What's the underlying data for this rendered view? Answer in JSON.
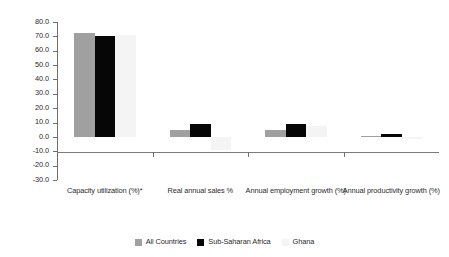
{
  "chart_data": {
    "type": "bar",
    "title": "",
    "subtitle": "",
    "xlabel": "",
    "ylabel": "",
    "grid": false,
    "legend_position": "bottom",
    "ylim": [
      -30.0,
      80.0
    ],
    "ytick_step": 10.0,
    "ytick_labels": [
      "80.0",
      "70.0",
      "60.0",
      "50.0",
      "40.0",
      "30.0",
      "20.0",
      "10.0",
      "0.0",
      "-10.0",
      "-20.0",
      "-30.0"
    ],
    "ytick_values": [
      80.0,
      70.0,
      60.0,
      50.0,
      40.0,
      30.0,
      20.0,
      10.0,
      0.0,
      -10.0,
      -20.0,
      -30.0
    ],
    "categories": [
      "Capacity utilization (%)*",
      "Real annual sales %",
      "Annual employment growth (%)",
      "Annual productivity growth (%)"
    ],
    "series": [
      {
        "name": "All Countries",
        "color": "#a0a0a0",
        "values": [
          72.0,
          4.5,
          5.0,
          0.3
        ]
      },
      {
        "name": "Sub-Saharan Africa",
        "color": "#060606",
        "values": [
          70.0,
          9.0,
          9.0,
          2.0
        ]
      },
      {
        "name": "Ghana",
        "color": "#f4f4f4",
        "values": [
          71.0,
          -9.0,
          7.5,
          -1.5
        ]
      }
    ]
  },
  "legend": {
    "items": [
      {
        "label": "All Countries"
      },
      {
        "label": "Sub-Saharan Africa"
      },
      {
        "label": "Ghana"
      }
    ]
  }
}
